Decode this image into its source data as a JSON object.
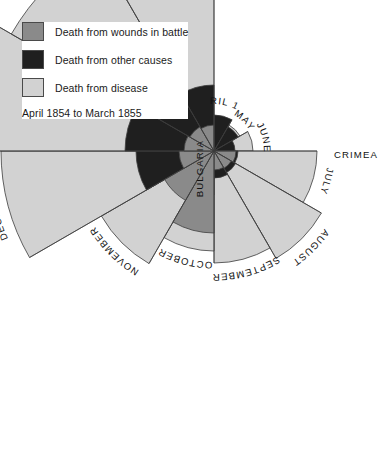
{
  "legend": {
    "items": [
      {
        "label": "Death from wounds in battle",
        "color": "#8a8a8a",
        "key": "wounds"
      },
      {
        "label": "Death from other causes",
        "color": "#1f1f1f",
        "key": "other"
      },
      {
        "label": "Death from disease",
        "color": "#d2d2d2",
        "key": "disease"
      }
    ],
    "subtitle": "April 1854 to March 1855"
  },
  "regions": [
    {
      "name": "BULGARIA",
      "angle": -90
    },
    {
      "name": "CRIMEA",
      "angle": 0
    }
  ],
  "chart_data": {
    "type": "pie",
    "variant": "polar-area-rose-coxcomb",
    "subtitle": "April 1854 to March 1855",
    "center": {
      "x": 214,
      "y": 151
    },
    "start_angle_deg": -90,
    "sector_span_deg": 30,
    "direction": "clockwise",
    "radius_scale_px_per_unit": 1.0,
    "legend_position": "top-left",
    "grid": false,
    "categories": [
      "APRIL 1854",
      "MAY",
      "JUNE",
      "JULY",
      "AUGUST",
      "SEPTEMBER",
      "OCTOBER",
      "NOVEMBER",
      "DECEMBER",
      "JANUARY 1855",
      "FEBRUARY",
      "MARCH 1855"
    ],
    "series": [
      {
        "name": "Death from disease",
        "key": "disease",
        "color": "#d2d2d2",
        "radii": [
          26,
          30,
          39,
          103,
          124,
          112,
          100,
          130,
          213,
          285,
          234,
          176
        ]
      },
      {
        "name": "Death from other causes",
        "key": "other",
        "color": "#1f1f1f",
        "radii": [
          36,
          28,
          21,
          24,
          25,
          27,
          44,
          54,
          78,
          89,
          84,
          66
        ]
      },
      {
        "name": "Death from wounds in battle",
        "key": "wounds",
        "color": "#8a8a8a",
        "radii": [
          0,
          0,
          0,
          22,
          20,
          19,
          82,
          57,
          35,
          30,
          28,
          26
        ]
      }
    ],
    "month_labels": [
      {
        "text": "APRIL 1854",
        "angle": -180,
        "two_line": true
      },
      {
        "text": "MAY",
        "angle": -150
      },
      {
        "text": "JUNE",
        "angle": -120
      },
      {
        "text": "JULY",
        "angle": -75
      },
      {
        "text": "AUGUST",
        "angle": -48
      },
      {
        "text": "SEPTEMBER",
        "angle": -18
      },
      {
        "text": "OCTOBER",
        "angle": 14
      },
      {
        "text": "NOVEMBER",
        "angle": 44
      },
      {
        "text": "DECEMBER",
        "angle": 72
      },
      {
        "text": "JANUARY 1855",
        "angle": 104
      },
      {
        "text": "FEBRUARY",
        "angle": 138
      },
      {
        "text": "MARCH 1855",
        "angle": 166
      }
    ]
  }
}
